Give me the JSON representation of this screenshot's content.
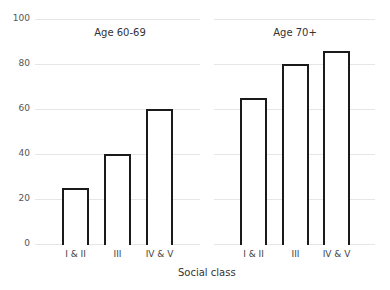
{
  "chart_data": [
    {
      "type": "bar",
      "title": "Age  60-69",
      "categories": [
        "I & II",
        "III",
        "IV & V"
      ],
      "values": [
        25,
        40,
        60
      ],
      "xlabel": "Social  class",
      "ylabel": "",
      "ylim": [
        0,
        100
      ],
      "yticks": [
        0,
        20,
        40,
        60,
        80,
        100
      ],
      "grid": true
    },
    {
      "type": "bar",
      "title": "Age 70+",
      "categories": [
        "I & II",
        "III",
        "IV & V"
      ],
      "values": [
        65,
        80,
        86
      ],
      "xlabel": "Social  class",
      "ylabel": "",
      "ylim": [
        0,
        100
      ],
      "yticks": [
        0,
        20,
        40,
        60,
        80,
        100
      ],
      "grid": true
    }
  ],
  "labels": {
    "panel_left_title": "Age  60-69",
    "panel_right_title": "Age 70+",
    "xlabel": "Social  class",
    "yticks": [
      "100",
      "80",
      "60",
      "40",
      "20",
      "0"
    ]
  }
}
